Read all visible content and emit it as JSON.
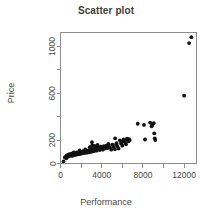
{
  "chart_data": {
    "type": "scatter",
    "title": "Scatter plot",
    "xlabel": "Performance",
    "ylabel": "Price",
    "grid": false,
    "legend": false,
    "xlim": [
      0,
      13200
    ],
    "ylim": [
      0,
      1120
    ],
    "x_ticks_labeled": [
      0,
      4000,
      8000,
      12000
    ],
    "x_tick_labels": [
      "0",
      "4000",
      "8000",
      "12000"
    ],
    "x_ticks_minor": [
      2000,
      6000,
      10000
    ],
    "y_ticks_labeled": [
      0,
      200,
      600,
      1000
    ],
    "y_tick_labels": [
      "0",
      "200",
      "600",
      "1000"
    ],
    "y_ticks_minor": [
      400,
      800
    ],
    "point_color": "#111111",
    "point_size": 1.9,
    "series": [
      {
        "name": "models",
        "x": [
          300,
          420,
          520,
          560,
          610,
          700,
          760,
          820,
          880,
          930,
          980,
          1050,
          1120,
          1180,
          1240,
          1300,
          1360,
          1420,
          1480,
          1540,
          1600,
          1660,
          1720,
          1800,
          1860,
          1920,
          1980,
          2050,
          2120,
          2200,
          2280,
          2360,
          2440,
          2520,
          2600,
          2680,
          2760,
          2840,
          2920,
          3000,
          3080,
          3160,
          3240,
          3320,
          3400,
          3500,
          3600,
          3700,
          3800,
          3900,
          4000,
          4100,
          4200,
          4320,
          4440,
          4560,
          4680,
          4800,
          4920,
          5040,
          5160,
          5280,
          5400,
          5520,
          5640,
          5760,
          5880,
          6000,
          6120,
          6240,
          6360,
          6480,
          6600,
          6720,
          5300,
          5450,
          3050,
          2950,
          3150,
          2400,
          1850,
          1300,
          7500,
          8100,
          8700,
          8900,
          9050,
          9150,
          9200,
          8200,
          9100,
          8850,
          12000,
          12480,
          12700,
          6650,
          6450,
          6250,
          5900,
          4650,
          3450,
          2150
        ],
        "y": [
          18,
          52,
          60,
          45,
          70,
          58,
          75,
          62,
          80,
          68,
          72,
          85,
          65,
          78,
          88,
          70,
          82,
          92,
          75,
          86,
          95,
          78,
          88,
          98,
          80,
          90,
          100,
          85,
          95,
          105,
          88,
          98,
          108,
          92,
          102,
          112,
          95,
          140,
          118,
          100,
          155,
          125,
          105,
          150,
          130,
          110,
          158,
          135,
          115,
          145,
          138,
          118,
          148,
          128,
          152,
          132,
          158,
          138,
          118,
          162,
          142,
          122,
          165,
          148,
          128,
          198,
          172,
          152,
          205,
          182,
          165,
          210,
          190,
          200,
          215,
          175,
          182,
          130,
          108,
          120,
          112,
          95,
          340,
          330,
          350,
          330,
          345,
          215,
          200,
          205,
          258,
          318,
          580,
          1030,
          1080,
          208,
          212,
          196,
          188,
          168,
          142,
          102
        ]
      }
    ]
  }
}
